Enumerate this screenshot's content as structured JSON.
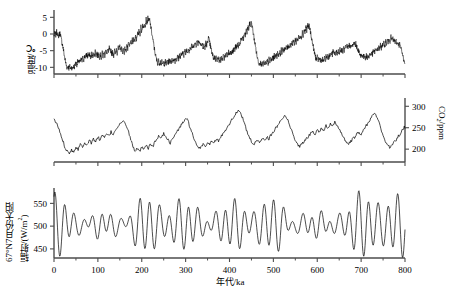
{
  "figure": {
    "title": "",
    "xaxis": {
      "label": "年代/ka",
      "min": 0,
      "max": 800,
      "ticks": [
        0,
        100,
        200,
        300,
        400,
        500,
        600,
        700,
        800
      ],
      "minor_step": 50
    },
    "colors": {
      "line": "#000000",
      "axis": "#4d4d4d"
    }
  },
  "chart_data": [
    {
      "type": "line",
      "title": "",
      "xlabel": "年代/ka",
      "ylabel": "温度/℃",
      "ylabel_parts": {
        "text": "温度/℃"
      },
      "xlim": [
        0,
        800
      ],
      "ylim": [
        -12,
        6
      ],
      "yticks": [
        5,
        0,
        -5,
        -10
      ],
      "ytick_labels": [
        "5",
        "0",
        "-5",
        "-10"
      ],
      "grid": false,
      "legend": "none",
      "x": [
        0,
        2,
        4,
        6,
        8,
        10,
        12,
        14,
        16,
        18,
        20,
        22,
        24,
        26,
        28,
        30,
        32,
        34,
        36,
        38,
        40,
        42,
        44,
        46,
        48,
        50,
        52,
        54,
        56,
        58,
        60,
        62,
        64,
        66,
        68,
        70,
        72,
        74,
        76,
        78,
        80,
        82,
        84,
        86,
        88,
        90,
        92,
        94,
        96,
        98,
        100,
        102,
        104,
        106,
        108,
        110,
        112,
        114,
        116,
        118,
        120,
        122,
        124,
        126,
        128,
        130,
        132,
        134,
        136,
        138,
        140,
        142,
        144,
        146,
        148,
        150,
        152,
        154,
        156,
        158,
        160,
        162,
        164,
        166,
        168,
        170,
        172,
        174,
        176,
        178,
        180,
        182,
        184,
        186,
        188,
        190,
        192,
        194,
        196,
        198,
        200,
        202,
        204,
        206,
        208,
        210,
        212,
        214,
        216,
        218,
        220,
        222,
        224,
        226,
        228,
        230,
        232,
        234,
        236,
        238,
        240,
        242,
        244,
        246,
        248,
        250,
        252,
        254,
        256,
        258,
        260,
        262,
        264,
        266,
        268,
        270,
        272,
        274,
        276,
        278,
        280,
        282,
        284,
        286,
        288,
        290,
        292,
        294,
        296,
        298,
        300,
        302,
        304,
        306,
        308,
        310,
        312,
        314,
        316,
        318,
        320,
        322,
        324,
        326,
        328,
        330,
        332,
        334,
        336,
        338,
        340,
        342,
        344,
        346,
        348,
        350,
        352,
        354,
        356,
        358,
        360,
        362,
        364,
        366,
        368,
        370,
        372,
        374,
        376,
        378,
        380,
        382,
        384,
        386,
        388,
        390,
        392,
        394,
        396,
        398,
        400,
        402,
        404,
        406,
        408,
        410,
        412,
        414,
        416,
        418,
        420,
        422,
        424,
        426,
        428,
        430,
        432,
        434,
        436,
        438,
        440,
        442,
        444,
        446,
        448,
        450,
        452,
        454,
        456,
        458,
        460,
        462,
        464,
        466,
        468,
        470,
        472,
        474,
        476,
        478,
        480,
        482,
        484,
        486,
        488,
        490,
        492,
        494,
        496,
        498,
        500,
        502,
        504,
        506,
        508,
        510,
        512,
        514,
        516,
        518,
        520,
        522,
        524,
        526,
        528,
        530,
        532,
        534,
        536,
        538,
        540,
        542,
        544,
        546,
        548,
        550,
        552,
        554,
        556,
        558,
        560,
        562,
        564,
        566,
        568,
        570,
        572,
        574,
        576,
        578,
        580,
        582,
        584,
        586,
        588,
        590,
        592,
        594,
        596,
        598,
        600,
        602,
        604,
        606,
        608,
        610,
        612,
        614,
        616,
        618,
        620,
        622,
        624,
        626,
        628,
        630,
        632,
        634,
        636,
        638,
        640,
        642,
        644,
        646,
        648,
        650,
        652,
        654,
        656,
        658,
        660,
        662,
        664,
        666,
        668,
        670,
        672,
        674,
        676,
        678,
        680,
        682,
        684,
        686,
        688,
        690,
        692,
        694,
        696,
        698,
        700,
        702,
        704,
        706,
        708,
        710,
        712,
        714,
        716,
        718,
        720,
        722,
        724,
        726,
        728,
        730,
        732,
        734,
        736,
        738,
        740,
        742,
        744,
        746,
        748,
        750,
        752,
        754,
        756,
        758,
        760,
        762,
        764,
        766,
        768,
        770,
        772,
        774,
        776,
        778,
        780,
        782,
        784,
        786,
        788,
        790,
        792,
        794,
        796,
        798,
        800
      ],
      "y": [
        -0.5,
        0.2,
        -0.3,
        0.6,
        0.1,
        -0.6,
        -0.2,
        0.4,
        -1.2,
        -2.4,
        -3.6,
        -5.2,
        -6.8,
        -8.2,
        -9.4,
        -10.1,
        -9.6,
        -10.3,
        -9.8,
        -10.4,
        -9.9,
        -10.5,
        -9.7,
        -10.0,
        -9.2,
        -8.6,
        -9.1,
        -8.2,
        -8.8,
        -7.9,
        -8.5,
        -7.6,
        -8.2,
        -6.9,
        -7.8,
        -6.4,
        -7.2,
        -6.0,
        -7.0,
        -5.8,
        -6.8,
        -6.2,
        -7.2,
        -6.0,
        -7.0,
        -5.5,
        -6.6,
        -5.2,
        -6.4,
        -5.6,
        -6.8,
        -5.9,
        -7.0,
        -6.1,
        -7.2,
        -5.8,
        -6.9,
        -5.4,
        -6.5,
        -5.0,
        -6.2,
        -4.6,
        -5.8,
        -4.2,
        -5.4,
        -4.8,
        -6.0,
        -5.2,
        -6.4,
        -4.9,
        -6.1,
        -4.4,
        -5.6,
        -4.0,
        -5.2,
        -3.6,
        -4.8,
        -4.2,
        -5.4,
        -4.6,
        -5.8,
        -4.1,
        -5.3,
        -3.4,
        -4.6,
        -2.8,
        -4.0,
        -2.2,
        -3.4,
        -1.6,
        -2.8,
        -1.0,
        -2.2,
        -0.4,
        -1.6,
        0.4,
        -0.8,
        1.2,
        0.0,
        2.0,
        0.8,
        2.8,
        1.6,
        3.6,
        2.4,
        4.4,
        3.2,
        4.9,
        3.8,
        4.2,
        2.6,
        1.0,
        -0.6,
        -2.2,
        -3.8,
        -5.4,
        -6.8,
        -7.8,
        -8.6,
        -7.9,
        -8.8,
        -8.1,
        -9.0,
        -8.3,
        -9.2,
        -8.4,
        -9.3,
        -8.2,
        -9.1,
        -8.0,
        -8.9,
        -7.8,
        -8.7,
        -7.6,
        -8.5,
        -7.4,
        -8.3,
        -7.2,
        -8.1,
        -7.0,
        -7.9,
        -6.6,
        -7.5,
        -6.2,
        -7.1,
        -5.8,
        -6.7,
        -5.4,
        -6.3,
        -5.0,
        -5.9,
        -4.6,
        -5.5,
        -4.2,
        -5.1,
        -3.8,
        -4.7,
        -3.4,
        -4.3,
        -3.0,
        -3.9,
        -2.6,
        -3.5,
        -2.2,
        -3.1,
        -1.8,
        -2.8,
        -2.4,
        -3.6,
        -3.0,
        -4.2,
        -3.4,
        -4.6,
        -2.6,
        -3.8,
        -2.0,
        -1.2,
        -2.2,
        -3.4,
        -4.6,
        -5.8,
        -6.6,
        -7.4,
        -6.8,
        -7.6,
        -7.0,
        -7.8,
        -7.2,
        -8.0,
        -7.4,
        -8.2,
        -7.0,
        -7.8,
        -6.6,
        -7.4,
        -6.2,
        -7.0,
        -5.8,
        -6.6,
        -5.4,
        -6.2,
        -5.0,
        -5.8,
        -4.6,
        -5.4,
        -4.2,
        -5.0,
        -3.6,
        -4.4,
        -3.0,
        -3.8,
        -2.4,
        -3.2,
        -1.6,
        -2.4,
        -0.8,
        -1.6,
        0.2,
        -0.6,
        1.2,
        0.4,
        2.2,
        1.4,
        3.2,
        2.3,
        3.5,
        2.0,
        0.4,
        -1.2,
        -2.8,
        -4.4,
        -6.0,
        -7.4,
        -8.4,
        -9.0,
        -8.3,
        -9.1,
        -8.5,
        -9.3,
        -8.6,
        -9.4,
        -8.4,
        -9.2,
        -8.0,
        -8.8,
        -7.6,
        -8.4,
        -7.2,
        -8.0,
        -6.8,
        -7.6,
        -6.4,
        -7.2,
        -6.0,
        -6.8,
        -5.6,
        -6.4,
        -5.2,
        -6.0,
        -4.8,
        -5.6,
        -4.4,
        -5.2,
        -4.0,
        -4.8,
        -3.6,
        -4.4,
        -3.2,
        -4.0,
        -2.8,
        -3.6,
        -2.4,
        -3.2,
        -2.0,
        -2.8,
        -1.6,
        -2.4,
        -1.2,
        -2.0,
        -0.8,
        -1.6,
        -0.2,
        -1.0,
        0.6,
        -0.4,
        1.4,
        0.4,
        2.2,
        1.2,
        2.8,
        1.8,
        2.4,
        1.0,
        -0.4,
        -1.8,
        -3.2,
        -4.6,
        -5.8,
        -6.8,
        -7.6,
        -7.0,
        -7.8,
        -7.2,
        -8.0,
        -7.4,
        -8.2,
        -7.6,
        -8.4,
        -7.2,
        -8.0,
        -6.8,
        -7.6,
        -6.4,
        -7.2,
        -6.0,
        -6.8,
        -5.6,
        -6.4,
        -5.2,
        -6.0,
        -5.6,
        -6.4,
        -5.2,
        -6.0,
        -4.8,
        -5.6,
        -4.4,
        -5.2,
        -4.8,
        -5.6,
        -4.2,
        -5.0,
        -3.8,
        -4.6,
        -3.4,
        -4.2,
        -3.0,
        -3.8,
        -3.4,
        -4.2,
        -3.0,
        -3.8,
        -2.6,
        -3.4,
        -3.0,
        -3.8,
        -4.4,
        -5.2,
        -5.8,
        -6.6,
        -6.0,
        -6.8,
        -6.2,
        -7.0,
        -6.4,
        -7.2,
        -6.6,
        -7.4,
        -6.2,
        -7.0,
        -5.8,
        -6.6,
        -5.4,
        -6.2,
        -5.0,
        -5.8,
        -4.6,
        -5.4,
        -4.2,
        -5.0,
        -3.8,
        -4.6,
        -3.4,
        -4.2,
        -3.0,
        -3.8,
        -2.6,
        -3.4,
        -2.2,
        -3.0,
        -1.8,
        -2.6,
        -1.4,
        -2.2,
        -1.0,
        -1.8,
        -1.4,
        -2.2,
        -1.8,
        -2.6,
        -2.2,
        -3.0,
        -2.6,
        -3.4,
        -3.0,
        -4.0,
        -5.0,
        -6.0,
        -7.0,
        -7.8,
        -8.4,
        -7.9,
        -8.6,
        -8.1,
        -8.8,
        -8.3,
        -9.0,
        -8.4,
        -9.1,
        -8.2,
        -8.9,
        -8.0,
        -8.7,
        -7.8,
        -8.5,
        -7.6,
        -8.3,
        -7.4,
        -8.1,
        -7.2,
        -7.9,
        -6.8,
        -7.5,
        -6.4,
        -7.1,
        -6.0,
        -6.7,
        -5.6,
        -6.3,
        -5.2,
        -5.9,
        -4.8,
        -5.5,
        -4.4,
        -5.1,
        -4.0,
        -4.7,
        -3.6,
        -4.3,
        -3.2,
        -3.9,
        -2.8,
        -3.5,
        -2.4,
        -3.1,
        -2.6,
        -3.4,
        -3.0,
        -3.8,
        -3.4,
        -4.2,
        -3.8,
        -4.6,
        -4.2,
        -5.0,
        -4.6,
        -5.4,
        -5.0,
        -5.8,
        -6.4,
        -7.2,
        -7.8,
        -8.4,
        -8.0,
        -8.6,
        -8.2,
        -8.8,
        -8.4,
        -9.0,
        -8.6,
        -9.2,
        -8.4,
        -9.0,
        -8.0,
        -8.6,
        -7.6,
        -8.2,
        -7.2,
        -7.8,
        -6.8,
        -7.4,
        -6.4,
        -7.0,
        -6.0,
        -6.6,
        -5.6,
        -6.2,
        -5.2,
        -5.8,
        -4.8,
        -5.4,
        -4.4,
        -5.0,
        -4.0,
        -4.6,
        -3.6,
        -4.2,
        -3.2,
        -3.8,
        -2.8,
        -3.4,
        -2.4,
        -3.0,
        -2.0,
        -2.6,
        -1.6,
        -2.2,
        -1.2,
        -1.8,
        -0.8,
        -1.6,
        -3.0,
        -4.6,
        -6.2,
        -7.6,
        -8.6,
        -9.0,
        -8.8
      ]
    },
    {
      "type": "line",
      "title": "",
      "xlabel": "年代/ka",
      "ylabel": "CO2/ppm",
      "ylabel_parts": {
        "pre": "CO",
        "sub": "2",
        "post": "/ppm"
      },
      "ylabel_side": "right",
      "xlim": [
        0,
        800
      ],
      "ylim": [
        170,
        310
      ],
      "yticks": [
        300,
        250,
        200
      ],
      "ytick_labels": [
        "300",
        "250",
        "200"
      ],
      "grid": false,
      "legend": "none",
      "x": [
        0,
        5,
        10,
        15,
        20,
        25,
        30,
        35,
        40,
        45,
        50,
        55,
        60,
        65,
        70,
        75,
        80,
        85,
        90,
        95,
        100,
        105,
        110,
        115,
        120,
        125,
        130,
        135,
        140,
        145,
        150,
        155,
        160,
        165,
        170,
        175,
        180,
        185,
        190,
        195,
        200,
        205,
        210,
        215,
        220,
        225,
        230,
        235,
        240,
        245,
        250,
        255,
        260,
        265,
        270,
        275,
        280,
        285,
        290,
        295,
        300,
        305,
        310,
        315,
        320,
        325,
        330,
        335,
        340,
        345,
        350,
        355,
        360,
        365,
        370,
        375,
        380,
        385,
        390,
        395,
        400,
        405,
        410,
        415,
        420,
        425,
        430,
        435,
        440,
        445,
        450,
        455,
        460,
        465,
        470,
        475,
        480,
        485,
        490,
        495,
        500,
        505,
        510,
        515,
        520,
        525,
        530,
        535,
        540,
        545,
        550,
        555,
        560,
        565,
        570,
        575,
        580,
        585,
        590,
        595,
        600,
        605,
        610,
        615,
        620,
        625,
        630,
        635,
        640,
        645,
        650,
        655,
        660,
        665,
        670,
        675,
        680,
        685,
        690,
        695,
        700,
        705,
        710,
        715,
        720,
        725,
        730,
        735,
        740,
        745,
        750,
        755,
        760,
        765,
        770,
        775,
        780,
        785,
        790,
        795,
        800
      ],
      "y": [
        268,
        262,
        250,
        235,
        220,
        205,
        196,
        192,
        198,
        194,
        205,
        200,
        212,
        206,
        216,
        210,
        220,
        214,
        224,
        218,
        228,
        222,
        232,
        226,
        236,
        230,
        240,
        234,
        246,
        252,
        258,
        264,
        262,
        256,
        240,
        222,
        206,
        196,
        200,
        194,
        204,
        198,
        208,
        202,
        212,
        206,
        216,
        224,
        232,
        226,
        236,
        230,
        222,
        214,
        224,
        232,
        240,
        248,
        256,
        264,
        272,
        266,
        252,
        236,
        220,
        208,
        200,
        206,
        212,
        206,
        216,
        210,
        220,
        214,
        224,
        218,
        228,
        236,
        244,
        252,
        260,
        268,
        276,
        284,
        292,
        286,
        272,
        256,
        240,
        228,
        218,
        210,
        216,
        222,
        216,
        226,
        220,
        230,
        224,
        234,
        240,
        248,
        256,
        264,
        272,
        280,
        274,
        262,
        248,
        234,
        222,
        212,
        206,
        212,
        218,
        224,
        230,
        236,
        242,
        236,
        246,
        240,
        250,
        244,
        254,
        248,
        258,
        252,
        262,
        256,
        248,
        238,
        228,
        218,
        210,
        216,
        222,
        228,
        234,
        240,
        234,
        244,
        252,
        260,
        268,
        276,
        284,
        278,
        264,
        248,
        232,
        220,
        210,
        204,
        210,
        216,
        222,
        230,
        238,
        246,
        254,
        248
      ]
    },
    {
      "type": "line",
      "title": "",
      "xlabel": "年代/ka",
      "ylabel": "67°N7月份太阳辐射/(W/m2)",
      "ylabel_parts": {
        "line1": "67°N7月份太阳",
        "line2_pre": "辐射/(W/m",
        "line2_sup": "2",
        "line2_post": ")"
      },
      "xlim": [
        0,
        800
      ],
      "ylim": [
        430,
        575
      ],
      "yticks": [
        550,
        500,
        450
      ],
      "ytick_labels": [
        "550",
        "500",
        "450"
      ],
      "grid": false,
      "legend": "none",
      "model": {
        "note": "Sum of precession (~21 kyr) and obliquity (~41 kyr) harmonics, mean 503 W/m2"
      },
      "components": [
        {
          "name": "precession",
          "amplitude": 33,
          "period": 21.7,
          "phase": 1.2
        },
        {
          "name": "precession2",
          "amplitude": 14,
          "period": 23.7,
          "phase": 0.4
        },
        {
          "name": "obliquity",
          "amplitude": 10,
          "period": 41.0,
          "phase": 2.0
        },
        {
          "name": "eccentricity-mod",
          "amplitude": 0.42,
          "period": 98.0,
          "phase": 0.9
        },
        {
          "name": "eccentricity-mod2",
          "amplitude": 0.25,
          "period": 412.0,
          "phase": 2.6
        }
      ],
      "mean": 503
    }
  ]
}
